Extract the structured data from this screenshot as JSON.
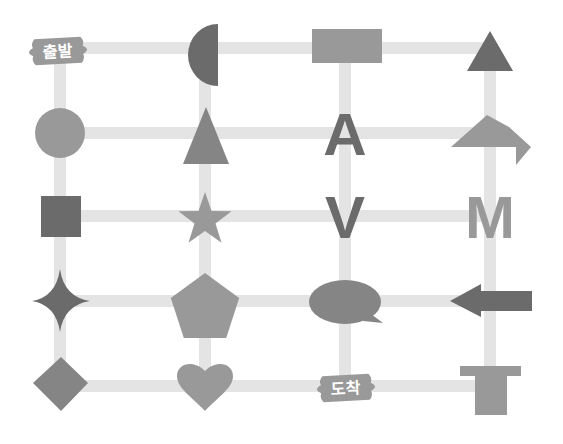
{
  "colors": {
    "line": "#e4e4e4",
    "dark": "#6b6b6b",
    "medium": "#858585",
    "light": "#999999",
    "background": "#ffffff",
    "label_text": "#ffffff"
  },
  "grid": {
    "columns": 4,
    "rows": 5
  },
  "labels": {
    "start": "출발",
    "end": "도착"
  },
  "nodes": [
    {
      "row": 0,
      "col": 0,
      "shape": "start-sign",
      "text": "출발",
      "tone": "light"
    },
    {
      "row": 0,
      "col": 1,
      "shape": "half-circle",
      "tone": "dark"
    },
    {
      "row": 0,
      "col": 2,
      "shape": "rectangle",
      "tone": "light"
    },
    {
      "row": 0,
      "col": 3,
      "shape": "triangle",
      "tone": "dark"
    },
    {
      "row": 1,
      "col": 0,
      "shape": "circle",
      "tone": "light"
    },
    {
      "row": 1,
      "col": 1,
      "shape": "tall-triangle",
      "tone": "medium"
    },
    {
      "row": 1,
      "col": 2,
      "shape": "letter",
      "text": "A",
      "tone": "dark"
    },
    {
      "row": 1,
      "col": 3,
      "shape": "turn-arrow",
      "tone": "light"
    },
    {
      "row": 2,
      "col": 0,
      "shape": "square",
      "tone": "dark"
    },
    {
      "row": 2,
      "col": 1,
      "shape": "star",
      "tone": "light"
    },
    {
      "row": 2,
      "col": 2,
      "shape": "letter",
      "text": "V",
      "tone": "dark"
    },
    {
      "row": 2,
      "col": 3,
      "shape": "letter",
      "text": "M",
      "tone": "light"
    },
    {
      "row": 3,
      "col": 0,
      "shape": "four-point-star",
      "tone": "dark"
    },
    {
      "row": 3,
      "col": 1,
      "shape": "pentagon",
      "tone": "light"
    },
    {
      "row": 3,
      "col": 2,
      "shape": "speech-bubble",
      "tone": "medium"
    },
    {
      "row": 3,
      "col": 3,
      "shape": "left-arrow",
      "tone": "dark"
    },
    {
      "row": 4,
      "col": 0,
      "shape": "diamond",
      "tone": "medium"
    },
    {
      "row": 4,
      "col": 1,
      "shape": "heart",
      "tone": "light"
    },
    {
      "row": 4,
      "col": 2,
      "shape": "end-sign",
      "text": "도착",
      "tone": "light"
    },
    {
      "row": 4,
      "col": 3,
      "shape": "t-shape",
      "tone": "light"
    }
  ]
}
